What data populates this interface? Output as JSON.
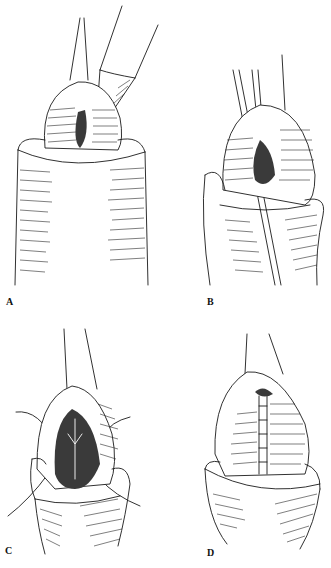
{
  "figure": {
    "panels": [
      {
        "id": "A",
        "label": "A",
        "description": "Forceps and scalpel incising the glans (ventral meatal incision)"
      },
      {
        "id": "B",
        "label": "B",
        "description": "Forceps spreading incision, deeper dissection"
      },
      {
        "id": "C",
        "label": "C",
        "description": "Glans wings open with sutures placed"
      },
      {
        "id": "D",
        "label": "D",
        "description": "Closed glans with interrupted suture line"
      }
    ],
    "colors": {
      "ink": "#1a1a1a",
      "background": "#ffffff"
    }
  }
}
